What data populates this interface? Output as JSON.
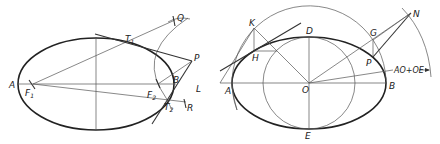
{
  "figure": {
    "left": {
      "title": "Tangent from external point using foci",
      "labels": {
        "A": "A",
        "F1": "F",
        "F1_sub": "1",
        "F2": "F",
        "F2_sub": "2",
        "T1": "T",
        "T1_sub": "1",
        "T2": "T",
        "T2_sub": "2",
        "B": "B",
        "P": "P",
        "Q": "Q",
        "R": "R"
      }
    },
    "right": {
      "title": "Tangent via auxiliary circles",
      "labels": {
        "K": "K",
        "H": "H",
        "L": "L",
        "A": "A",
        "D": "D",
        "O": "O",
        "E": "E",
        "B": "B",
        "G": "G",
        "P": "P",
        "N": "N",
        "radius_note": "AO+OE"
      }
    },
    "colors": {
      "ink": "#222222",
      "construction": "#555555",
      "background": "#ffffff"
    }
  }
}
